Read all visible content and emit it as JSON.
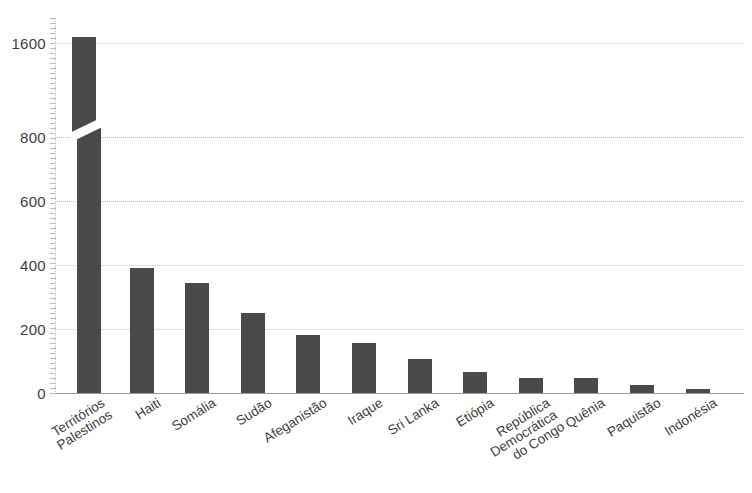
{
  "chart_data": {
    "type": "bar",
    "title": "",
    "subtitle": "",
    "xlabel": "",
    "ylabel": "",
    "orientation": "vertical",
    "grid": true,
    "legend": false,
    "bar_color": "#4a4a4a",
    "gridline_color": "#c9c9c9",
    "axis_color": "#9a9a9a",
    "axis_break": {
      "present": true,
      "between": [
        800,
        1600
      ],
      "style": "diagonal-slash"
    },
    "ylim": [
      0,
      1700
    ],
    "yticks": [
      0,
      200,
      400,
      600,
      800,
      1600
    ],
    "ytick_labels": [
      "0",
      "200",
      "400",
      "600",
      "800",
      "1600"
    ],
    "categories": [
      "Territórios Palestinos",
      "Haiti",
      "Somália",
      "Sudão",
      "Afeganistão",
      "Iraque",
      "Sri Lanka",
      "Etiópia",
      "República Democrática do Congo",
      "Quênia",
      "Paquistão",
      "Indonésia"
    ],
    "category_lines": [
      [
        "Territórios",
        "Palestinos"
      ],
      [
        "Haiti"
      ],
      [
        "Somália"
      ],
      [
        "Sudão"
      ],
      [
        "Afeganistão"
      ],
      [
        "Iraque"
      ],
      [
        "Sri Lanka"
      ],
      [
        "Etiópia"
      ],
      [
        "República",
        "Democrática",
        "do Congo"
      ],
      [
        "Quênia"
      ],
      [
        "Paquistão"
      ],
      [
        "Indonésia"
      ]
    ],
    "values": [
      1650,
      390,
      345,
      250,
      180,
      155,
      105,
      65,
      48,
      48,
      25,
      12
    ]
  }
}
